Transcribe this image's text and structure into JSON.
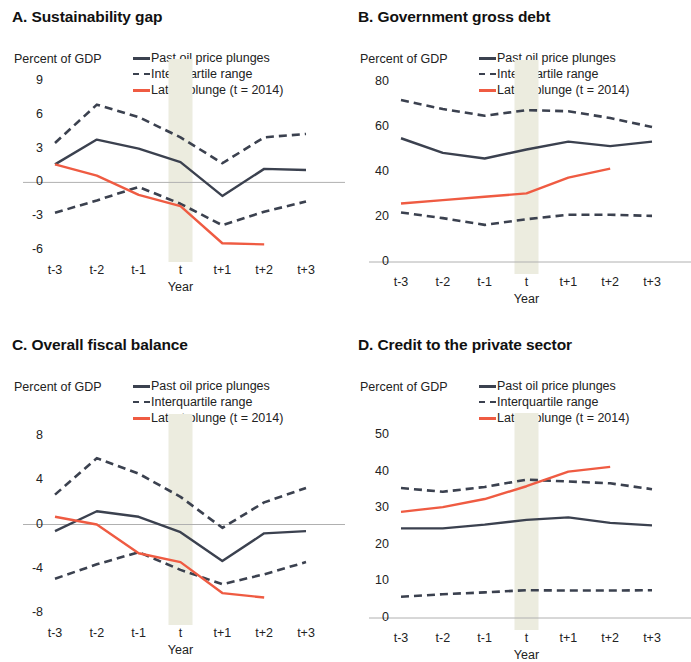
{
  "figure": {
    "colors": {
      "navy": "#3b414f",
      "red": "#ef5b42",
      "zero_line": "#b0b0b0",
      "band": "#ececdf",
      "text": "#222222"
    },
    "legend": {
      "items": [
        {
          "label": "Past oil price plunges",
          "style": "solid",
          "color": "#3b414f"
        },
        {
          "label": "Interquartile range",
          "style": "dashed",
          "color": "#3b414f"
        },
        {
          "label": "Latest plunge (t = 2014)",
          "style": "solid",
          "color": "#ef5b42"
        }
      ]
    },
    "axis_unit": "Percent of GDP",
    "xlabel": "Year",
    "xticks": [
      "t-3",
      "t-2",
      "t-1",
      "t",
      "t+1",
      "t+2",
      "t+3"
    ]
  },
  "chart_data": [
    {
      "id": "A",
      "type": "line",
      "title": "A. Sustainability gap",
      "xlabel": "Year",
      "ylabel": "Percent of GDP",
      "x": [
        "t-3",
        "t-2",
        "t-1",
        "t",
        "t+1",
        "t+2",
        "t+3"
      ],
      "yticks": [
        9,
        6,
        3,
        0,
        -3,
        -6
      ],
      "ylim": [
        -6,
        9
      ],
      "grid": false,
      "zero_line": true,
      "shaded_band": "t",
      "legend_position": "top-right",
      "series": [
        {
          "name": "Past oil price plunges",
          "style": "solid",
          "color": "#3b414f",
          "values": [
            1.6,
            3.8,
            3.0,
            1.8,
            -1.2,
            1.2,
            1.1
          ]
        },
        {
          "name": "Interquartile range (upper)",
          "style": "dashed",
          "color": "#3b414f",
          "values": [
            3.5,
            6.9,
            5.8,
            4.0,
            1.7,
            4.0,
            4.3
          ]
        },
        {
          "name": "Interquartile range (lower)",
          "style": "dashed",
          "color": "#3b414f",
          "values": [
            -2.7,
            -1.6,
            -0.4,
            -1.9,
            -3.8,
            -2.6,
            -1.7
          ]
        },
        {
          "name": "Latest plunge (t = 2014)",
          "style": "solid",
          "color": "#ef5b42",
          "values": [
            1.6,
            0.6,
            -1.1,
            -2.1,
            -5.4,
            -5.5,
            null
          ]
        }
      ]
    },
    {
      "id": "B",
      "type": "line",
      "title": "B. Government gross debt",
      "xlabel": "Year",
      "ylabel": "Percent of GDP",
      "x": [
        "t-3",
        "t-2",
        "t-1",
        "t",
        "t+1",
        "t+2",
        "t+3"
      ],
      "yticks": [
        80,
        60,
        40,
        20,
        0
      ],
      "ylim": [
        0,
        80
      ],
      "grid": false,
      "zero_line": true,
      "shaded_band": "t",
      "legend_position": "top-right",
      "series": [
        {
          "name": "Past oil price plunges",
          "style": "solid",
          "color": "#3b414f",
          "values": [
            55.0,
            48.5,
            46.0,
            50.0,
            53.5,
            51.5,
            53.5
          ]
        },
        {
          "name": "Interquartile range (upper)",
          "style": "dashed",
          "color": "#3b414f",
          "values": [
            72.0,
            68.0,
            65.0,
            67.5,
            67.0,
            64.0,
            60.0
          ]
        },
        {
          "name": "Interquartile range (lower)",
          "style": "dashed",
          "color": "#3b414f",
          "values": [
            22.0,
            19.5,
            16.5,
            19.0,
            21.0,
            21.0,
            20.5
          ]
        },
        {
          "name": "Latest plunge (t = 2014)",
          "style": "solid",
          "color": "#ef5b42",
          "values": [
            26.0,
            27.5,
            29.0,
            30.5,
            37.5,
            41.5,
            null
          ]
        }
      ]
    },
    {
      "id": "C",
      "type": "line",
      "title": "C. Overall fiscal balance",
      "xlabel": "Year",
      "ylabel": "Percent of GDP",
      "x": [
        "t-3",
        "t-2",
        "t-1",
        "t",
        "t+1",
        "t+2",
        "t+3"
      ],
      "yticks": [
        8,
        4,
        0,
        -4,
        -8
      ],
      "ylim": [
        -8,
        8
      ],
      "grid": false,
      "zero_line": true,
      "shaded_band": "t",
      "legend_position": "top-right",
      "series": [
        {
          "name": "Past oil price plunges",
          "style": "solid",
          "color": "#3b414f",
          "values": [
            -0.6,
            1.2,
            0.7,
            -0.7,
            -3.3,
            -0.8,
            -0.6
          ]
        },
        {
          "name": "Interquartile range (upper)",
          "style": "dashed",
          "color": "#3b414f",
          "values": [
            2.7,
            6.0,
            4.6,
            2.5,
            -0.3,
            2.0,
            3.3
          ]
        },
        {
          "name": "Interquartile range (lower)",
          "style": "dashed",
          "color": "#3b414f",
          "values": [
            -4.9,
            -3.6,
            -2.5,
            -4.1,
            -5.4,
            -4.5,
            -3.4
          ]
        },
        {
          "name": "Latest plunge (t = 2014)",
          "style": "solid",
          "color": "#ef5b42",
          "values": [
            0.7,
            0.0,
            -2.6,
            -3.4,
            -6.2,
            -6.6,
            null
          ]
        }
      ]
    },
    {
      "id": "D",
      "type": "line",
      "title": "D. Credit to the private sector",
      "xlabel": "Year",
      "ylabel": "Percent of GDP",
      "x": [
        "t-3",
        "t-2",
        "t-1",
        "t",
        "t+1",
        "t+2",
        "t+3"
      ],
      "yticks": [
        50,
        40,
        30,
        20,
        10,
        0
      ],
      "ylim": [
        0,
        50
      ],
      "grid": false,
      "zero_line": true,
      "shaded_band": "t",
      "legend_position": "top-right",
      "series": [
        {
          "name": "Past oil price plunges",
          "style": "solid",
          "color": "#3b414f",
          "values": [
            24.5,
            24.5,
            25.5,
            26.8,
            27.5,
            26.0,
            25.3
          ]
        },
        {
          "name": "Interquartile range (upper)",
          "style": "dashed",
          "color": "#3b414f",
          "values": [
            35.5,
            34.5,
            35.8,
            37.8,
            37.3,
            36.8,
            35.2
          ]
        },
        {
          "name": "Interquartile range (lower)",
          "style": "dashed",
          "color": "#3b414f",
          "values": [
            5.8,
            6.5,
            7.0,
            7.6,
            7.5,
            7.5,
            7.6
          ]
        },
        {
          "name": "Latest plunge (t = 2014)",
          "style": "solid",
          "color": "#ef5b42",
          "values": [
            29.0,
            30.3,
            32.5,
            36.0,
            40.0,
            41.3,
            null
          ]
        }
      ]
    }
  ]
}
